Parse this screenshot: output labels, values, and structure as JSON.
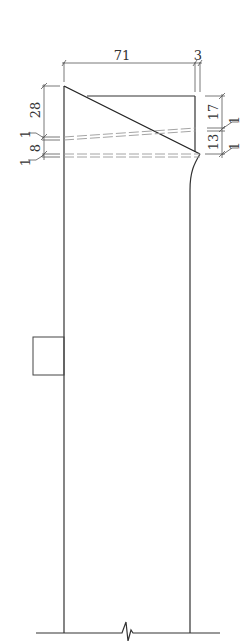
{
  "drawing": {
    "type": "engineering-section",
    "stroke_color": "#222222",
    "hidden_line_color": "#9a9a9a",
    "dimensions": {
      "top_width": "71",
      "top_offset": "3",
      "left_upper": "28",
      "left_gap_1": "1",
      "left_lower": "8",
      "left_gap_2": "1",
      "right_upper": "17",
      "right_gap_1": "1",
      "right_lower": "13",
      "right_gap_2": "1"
    }
  }
}
